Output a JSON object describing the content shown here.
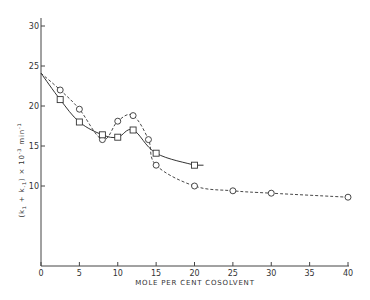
{
  "chart_data": {
    "type": "line",
    "title": "",
    "xlabel": "MOLE PER CENT COSOLVENT",
    "ylabel": "(k1 + k-1) × 10^-3 min^-1",
    "ylabel_parts": {
      "main": "(k",
      "sub1": "1",
      "plus": " + k",
      "sub2": "-1",
      "close": ") × 10",
      "exp": "-3",
      "unit": " min",
      "unit_exp": "-1"
    },
    "xlim": [
      0,
      40
    ],
    "ylim": [
      0,
      30
    ],
    "x_ticks": [
      0,
      5,
      10,
      15,
      20,
      25,
      30,
      35,
      40
    ],
    "y_ticks": [
      0,
      10,
      15,
      20,
      25,
      30
    ],
    "grid": false,
    "legend": null,
    "series": [
      {
        "name": "circles",
        "marker": "circle",
        "line_style": "dashed",
        "x": [
          0,
          2.5,
          5,
          8,
          10,
          12,
          14,
          15,
          20,
          25,
          30,
          40
        ],
        "y": [
          24.1,
          22.0,
          19.6,
          15.8,
          18.1,
          18.8,
          15.8,
          12.6,
          10.0,
          9.4,
          9.1,
          8.6
        ]
      },
      {
        "name": "squares",
        "marker": "square",
        "line_style": "solid",
        "x": [
          0,
          2.5,
          5,
          8,
          10,
          12,
          15,
          20
        ],
        "y": [
          24.1,
          20.8,
          18.0,
          16.4,
          16.1,
          17.0,
          14.1,
          12.6
        ]
      }
    ]
  }
}
